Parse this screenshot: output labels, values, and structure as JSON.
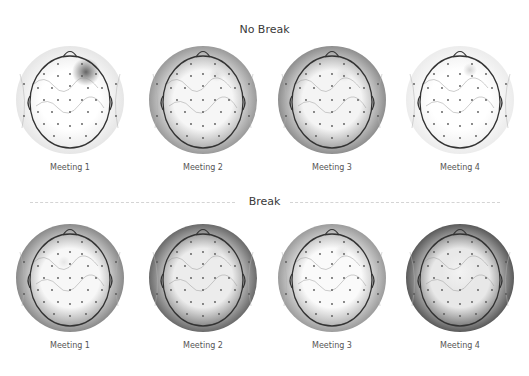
{
  "figure": {
    "rows": [
      {
        "title": "No Break",
        "maps": [
          {
            "label": "Meeting 1",
            "shade": "#ffffff",
            "edge": "#e6e6e6",
            "hotspot": {
              "x": 72,
              "y": 28,
              "r": 14,
              "color": "#555555"
            }
          },
          {
            "label": "Meeting 2",
            "shade": "#f6f6f6",
            "edge": "#9a9a9a",
            "hotspot": {
              "x": 70,
              "y": 30,
              "r": 8,
              "color": "#dddddd"
            }
          },
          {
            "label": "Meeting 3",
            "shade": "#f4f4f4",
            "edge": "#8e8e8e",
            "hotspot": {
              "x": 68,
              "y": 30,
              "r": 8,
              "color": "#e0e0e0"
            }
          },
          {
            "label": "Meeting 4",
            "shade": "#ffffff",
            "edge": "#ececec",
            "hotspot": {
              "x": 66,
              "y": 26,
              "r": 7,
              "color": "#cfcfcf"
            }
          }
        ]
      },
      {
        "title": "Break",
        "maps": [
          {
            "label": "Meeting 1",
            "shade": "#f7f7f7",
            "edge": "#8a8a8a",
            "hotspot": {
              "x": 50,
              "y": 40,
              "r": 6,
              "color": "#e4e4e4"
            }
          },
          {
            "label": "Meeting 2",
            "shade": "#ececec",
            "edge": "#6a6a6a",
            "hotspot": {
              "x": 68,
              "y": 30,
              "r": 8,
              "color": "#dcdcdc"
            }
          },
          {
            "label": "Meeting 3",
            "shade": "#fafafa",
            "edge": "#9c9c9c",
            "hotspot": {
              "x": 66,
              "y": 30,
              "r": 7,
              "color": "#e2e2e2"
            }
          },
          {
            "label": "Meeting 4",
            "shade": "#e8e8e8",
            "edge": "#5a5a5a",
            "hotspot": {
              "x": 56,
              "y": 50,
              "r": 18,
              "color": "#f4f4f4"
            }
          }
        ]
      }
    ]
  }
}
